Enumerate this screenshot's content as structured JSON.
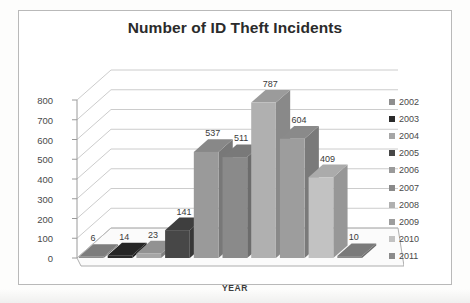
{
  "chart_data": {
    "type": "bar",
    "title": "Number of ID Theft Incidents",
    "xlabel": "YEAR",
    "ylabel": "",
    "categories": [
      "2002",
      "2003",
      "2004",
      "2005",
      "2006",
      "2007",
      "2008",
      "2009",
      "2010",
      "2011"
    ],
    "values": [
      6,
      14,
      23,
      141,
      537,
      511,
      787,
      604,
      409,
      10
    ],
    "ylim": [
      0,
      800
    ],
    "yticks": [
      0,
      100,
      200,
      300,
      400,
      500,
      600,
      700,
      800
    ],
    "ytick_labels": [
      "0",
      "100",
      "200",
      "300",
      "400",
      "500",
      "600",
      "700",
      "800"
    ],
    "grid": true,
    "legend_position": "right",
    "three_d": true,
    "series": [
      {
        "name": "Incidents",
        "values": [
          6,
          14,
          23,
          141,
          537,
          511,
          787,
          604,
          409,
          10
        ]
      }
    ],
    "data_labels": [
      "6",
      "14",
      "23",
      "141",
      "537",
      "511",
      "787",
      "604",
      "409",
      "10"
    ],
    "bar_colors": [
      "#8e8e8e",
      "#2b2b2b",
      "#a6a6a6",
      "#474747",
      "#9a9a9a",
      "#8a8a8a",
      "#b0b0b0",
      "#9d9d9d",
      "#c2c2c2",
      "#8b8b8b"
    ]
  },
  "legend": {
    "items": [
      {
        "label": "2002",
        "color": "#8e8e8e"
      },
      {
        "label": "2003",
        "color": "#2b2b2b"
      },
      {
        "label": "2004",
        "color": "#a6a6a6"
      },
      {
        "label": "2005",
        "color": "#474747"
      },
      {
        "label": "2006",
        "color": "#9a9a9a"
      },
      {
        "label": "2007",
        "color": "#8a8a8a"
      },
      {
        "label": "2008",
        "color": "#b0b0b0"
      },
      {
        "label": "2009",
        "color": "#9d9d9d"
      },
      {
        "label": "2010",
        "color": "#c2c2c2"
      },
      {
        "label": "2011",
        "color": "#8b8b8b"
      }
    ]
  },
  "colors": {
    "frame_border": "#b9b9b9",
    "grid_line": "#bfbfbf",
    "axis_line": "#9a9a9a",
    "floor": "#f2f2f2",
    "text": "#3a3a3a"
  }
}
